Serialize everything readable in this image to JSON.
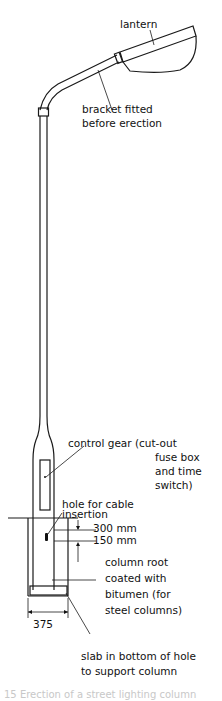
{
  "diagram": {
    "subject": "street lighting column",
    "labels": {
      "lantern": "lantern",
      "bracket_line1": "bracket fitted",
      "bracket_line2": "before erection",
      "control_gear_line1": "control gear (cut-out",
      "control_gear_line2": "fuse box",
      "control_gear_line3": "and time",
      "control_gear_line4": "switch)",
      "hole_line1": "hole for cable",
      "hole_line2": "insertion",
      "dim_300": "300 mm",
      "dim_150": "150 mm",
      "root_line1": "column root",
      "root_line2": "coated with",
      "root_line3": "bitumen (for",
      "root_line4": "steel columns)",
      "dim_375": "375",
      "slab_line1": "slab in bottom of hole",
      "slab_line2": "to support column"
    },
    "caption_partial": "15  Erection of a street lighting column"
  }
}
